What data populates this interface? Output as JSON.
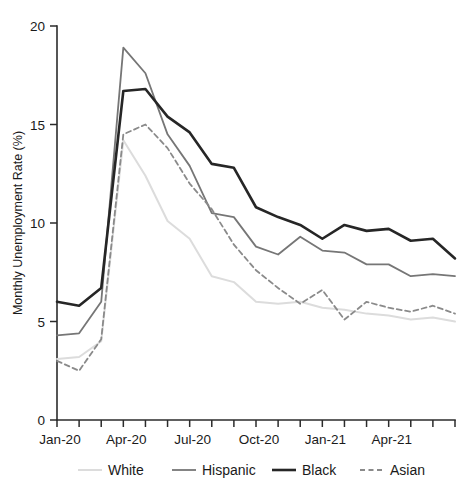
{
  "chart_data": {
    "type": "line",
    "title": "",
    "xlabel": "",
    "ylabel": "Monthly Unemployment Rate (%)",
    "ylim": [
      0,
      20
    ],
    "yticks": [
      0,
      5,
      10,
      15,
      20
    ],
    "ytick_labels": [
      "0",
      "5",
      "10",
      "15",
      "20"
    ],
    "grid": false,
    "legend_position": "bottom",
    "x": [
      "Jan-20",
      "Feb-20",
      "Mar-20",
      "Apr-20",
      "May-20",
      "Jun-20",
      "Jul-20",
      "Aug-20",
      "Sep-20",
      "Oct-20",
      "Nov-20",
      "Dec-20",
      "Jan-21",
      "Feb-21",
      "Mar-21",
      "Apr-21",
      "May-21",
      "Jun-21",
      "Jul-21"
    ],
    "xtick_labels": [
      "Jan-20",
      "Apr-20",
      "Jul-20",
      "Oct-20",
      "Jan-21",
      "Apr-21"
    ],
    "xtick_label_indices": [
      0,
      3,
      6,
      9,
      12,
      15
    ],
    "series": [
      {
        "name": "White",
        "color": "#dcdcdc",
        "style": "solid",
        "width": 2.0,
        "values": [
          3.1,
          3.2,
          4.0,
          14.2,
          12.4,
          10.1,
          9.2,
          7.3,
          7.0,
          6.0,
          5.9,
          6.0,
          5.7,
          5.6,
          5.4,
          5.3,
          5.1,
          5.2,
          5.0
        ]
      },
      {
        "name": "Hispanic",
        "color": "#767676",
        "style": "solid",
        "width": 1.8,
        "values": [
          4.3,
          4.4,
          6.0,
          18.9,
          17.6,
          14.5,
          12.9,
          10.5,
          10.3,
          8.8,
          8.4,
          9.3,
          8.6,
          8.5,
          7.9,
          7.9,
          7.3,
          7.4,
          7.3
        ]
      },
      {
        "name": "Black",
        "color": "#262626",
        "style": "solid",
        "width": 2.6,
        "values": [
          6.0,
          5.8,
          6.7,
          16.7,
          16.8,
          15.4,
          14.6,
          13.0,
          12.8,
          10.8,
          10.3,
          9.9,
          9.2,
          9.9,
          9.6,
          9.7,
          9.1,
          9.2,
          8.2
        ]
      },
      {
        "name": "Asian",
        "color": "#8a8a8a",
        "style": "dashed",
        "width": 1.8,
        "values": [
          3.0,
          2.5,
          4.1,
          14.5,
          15.0,
          13.8,
          12.0,
          10.7,
          8.9,
          7.6,
          6.7,
          5.9,
          6.6,
          5.1,
          6.0,
          5.7,
          5.5,
          5.8,
          5.4
        ]
      }
    ]
  },
  "axes": {
    "y_axis_label": "Monthly Unemployment Rate (%)"
  },
  "legend": {
    "items": [
      {
        "label": "White"
      },
      {
        "label": "Hispanic"
      },
      {
        "label": "Black"
      },
      {
        "label": "Asian"
      }
    ]
  }
}
